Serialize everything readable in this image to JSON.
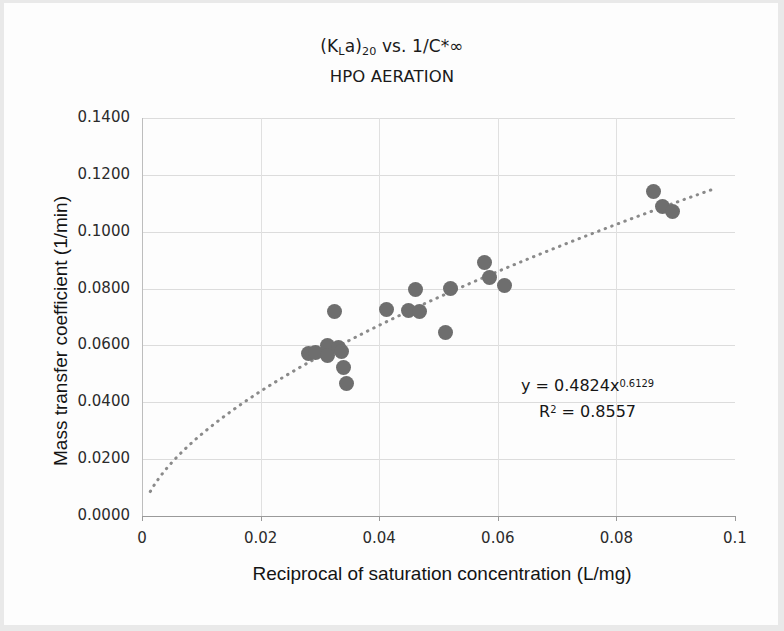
{
  "chart_data": {
    "type": "scatter",
    "title": "(KLa)20 vs. 1/C*∞",
    "title_line1_parts": {
      "pre": "(K",
      "sub1": "L",
      "mid": "a)",
      "sub2": "20",
      "post": " vs. 1/C*∞"
    },
    "subtitle": "HPO AERATION",
    "xlabel": "Reciprocal of saturation concentration (L/mg)",
    "ylabel": "Mass transfer coefficient (1/min)",
    "xlim": [
      0,
      0.1
    ],
    "ylim": [
      0,
      0.14
    ],
    "xticks": [
      "0",
      "0.02",
      "0.04",
      "0.06",
      "0.08",
      "0.1"
    ],
    "xtick_values": [
      0,
      0.02,
      0.04,
      0.06,
      0.08,
      0.1
    ],
    "yticks": [
      "0.0000",
      "0.0200",
      "0.0400",
      "0.0600",
      "0.0800",
      "0.1000",
      "0.1200",
      "0.1400"
    ],
    "ytick_values": [
      0,
      0.02,
      0.04,
      0.06,
      0.08,
      0.1,
      0.12,
      0.14
    ],
    "grid": true,
    "legend": false,
    "marker_color": "#6e6e6e",
    "trendline_color": "#8a8a8a",
    "points": [
      {
        "x": 0.0281,
        "y": 0.0573
      },
      {
        "x": 0.0292,
        "y": 0.0575
      },
      {
        "x": 0.0312,
        "y": 0.0598
      },
      {
        "x": 0.0313,
        "y": 0.0563
      },
      {
        "x": 0.0325,
        "y": 0.0718
      },
      {
        "x": 0.0332,
        "y": 0.0592
      },
      {
        "x": 0.0336,
        "y": 0.0578
      },
      {
        "x": 0.034,
        "y": 0.0522
      },
      {
        "x": 0.0345,
        "y": 0.0466
      },
      {
        "x": 0.0412,
        "y": 0.0726
      },
      {
        "x": 0.045,
        "y": 0.0722
      },
      {
        "x": 0.0462,
        "y": 0.0795
      },
      {
        "x": 0.0468,
        "y": 0.0721
      },
      {
        "x": 0.0512,
        "y": 0.0645
      },
      {
        "x": 0.052,
        "y": 0.08
      },
      {
        "x": 0.0578,
        "y": 0.0893
      },
      {
        "x": 0.0586,
        "y": 0.0838
      },
      {
        "x": 0.0612,
        "y": 0.081
      },
      {
        "x": 0.0862,
        "y": 0.1141
      },
      {
        "x": 0.0878,
        "y": 0.109
      },
      {
        "x": 0.0895,
        "y": 0.1071
      }
    ],
    "trendline": {
      "type": "power",
      "coefficient": 0.4824,
      "exponent": 0.6129,
      "x_start": 0.0014,
      "x_end": 0.0965
    },
    "annotations": {
      "equation_prefix": "y = 0.4824x",
      "equation_exponent": "0.6129",
      "r_squared_prefix": "R",
      "r_squared_sup": "2",
      "r_squared_value": " = 0.8557"
    }
  }
}
